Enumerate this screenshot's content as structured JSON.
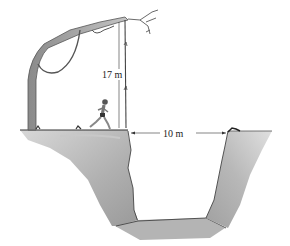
{
  "figure": {
    "labels": {
      "vine_length": "17 m",
      "ravine_width": "10 m"
    },
    "colors": {
      "ink": "#333333",
      "rock_light": "#cfcfcf",
      "rock_mid": "#a8a8a8",
      "rock_dark": "#8a8a8a",
      "tree": "#9a9a9a"
    }
  }
}
